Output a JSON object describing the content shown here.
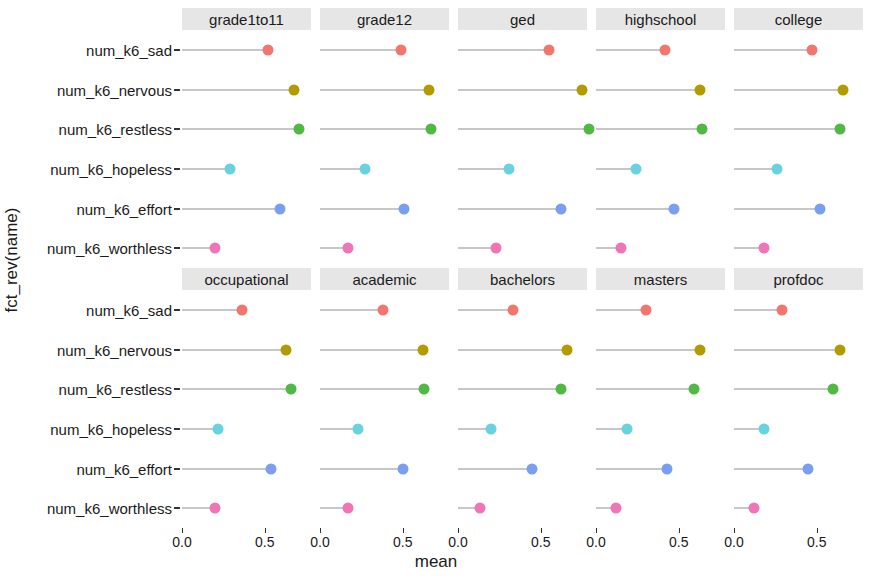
{
  "chart_data": {
    "type": "scatter",
    "title": "",
    "xlabel": "mean",
    "ylabel": "fct_rev(name)",
    "xlim": [
      0.0,
      0.78
    ],
    "xticks": [
      0.0,
      0.5
    ],
    "xtick_labels": [
      "0.0",
      "0.5"
    ],
    "grid": false,
    "legend": "none",
    "facet_layout": {
      "rows": 2,
      "cols": 5
    },
    "categories": [
      "num_k6_sad",
      "num_k6_nervous",
      "num_k6_restless",
      "num_k6_hopeless",
      "num_k6_effort",
      "num_k6_worthless"
    ],
    "category_colors": {
      "num_k6_sad": "#f2766d",
      "num_k6_nervous": "#b29b00",
      "num_k6_restless": "#4fb944",
      "num_k6_hopeless": "#69d2df",
      "num_k6_effort": "#7b9ff0",
      "num_k6_worthless": "#f075b7"
    },
    "facets": [
      {
        "label": "grade1to11",
        "values": [
          0.52,
          0.68,
          0.71,
          0.29,
          0.59,
          0.2
        ]
      },
      {
        "label": "grade12",
        "values": [
          0.49,
          0.66,
          0.67,
          0.27,
          0.51,
          0.17
        ]
      },
      {
        "label": "ged",
        "values": [
          0.55,
          0.75,
          0.79,
          0.31,
          0.62,
          0.23
        ]
      },
      {
        "label": "highschool",
        "values": [
          0.42,
          0.63,
          0.64,
          0.24,
          0.47,
          0.15
        ]
      },
      {
        "label": "college",
        "values": [
          0.47,
          0.66,
          0.64,
          0.26,
          0.52,
          0.18
        ]
      },
      {
        "label": "occupational",
        "values": [
          0.36,
          0.63,
          0.66,
          0.22,
          0.54,
          0.2
        ]
      },
      {
        "label": "academic",
        "values": [
          0.38,
          0.62,
          0.63,
          0.23,
          0.5,
          0.17
        ]
      },
      {
        "label": "bachelors",
        "values": [
          0.33,
          0.66,
          0.62,
          0.2,
          0.45,
          0.13
        ]
      },
      {
        "label": "masters",
        "values": [
          0.3,
          0.63,
          0.59,
          0.19,
          0.43,
          0.12
        ]
      },
      {
        "label": "profdoc",
        "values": [
          0.29,
          0.64,
          0.6,
          0.18,
          0.45,
          0.12
        ]
      }
    ]
  },
  "axes": {
    "y_title": "fct_rev(name)",
    "x_title": "mean"
  }
}
